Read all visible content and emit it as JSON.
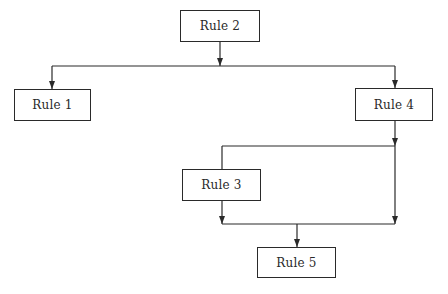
{
  "diagram": {
    "type": "flowchart",
    "colors": {
      "line": "#2a2a2a",
      "box_border": "#2a2a2a",
      "text": "#2a2a2a",
      "background": "#ffffff"
    },
    "nodes": [
      {
        "id": "rule2",
        "label": "Rule 2",
        "x": 180,
        "y": 10,
        "w": 80,
        "h": 32
      },
      {
        "id": "rule1",
        "label": "Rule 1",
        "x": 14,
        "y": 89,
        "w": 77,
        "h": 32
      },
      {
        "id": "rule4",
        "label": "Rule 4",
        "x": 355,
        "y": 88,
        "w": 78,
        "h": 33
      },
      {
        "id": "rule3",
        "label": "Rule 3",
        "x": 182,
        "y": 169,
        "w": 79,
        "h": 32
      },
      {
        "id": "rule5",
        "label": "Rule 5",
        "x": 257,
        "y": 247,
        "w": 79,
        "h": 31
      }
    ],
    "edges": [
      {
        "from": "rule2",
        "to": "junction-top",
        "label": ""
      },
      {
        "from": "junction-top",
        "to": "rule1",
        "label": ""
      },
      {
        "from": "junction-top",
        "to": "rule4",
        "label": ""
      },
      {
        "from": "rule4",
        "to": "junction-mid",
        "label": ""
      },
      {
        "from": "junction-mid",
        "to": "rule3",
        "label": ""
      },
      {
        "from": "junction-mid",
        "to": "junction-bottom",
        "label": ""
      },
      {
        "from": "rule3",
        "to": "junction-bottom",
        "label": ""
      },
      {
        "from": "junction-bottom",
        "to": "rule5",
        "label": ""
      }
    ]
  }
}
